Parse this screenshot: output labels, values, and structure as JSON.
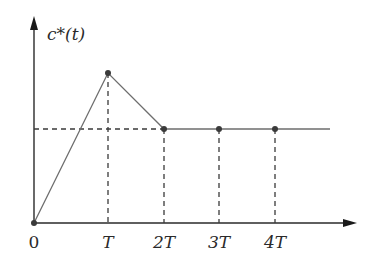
{
  "diagram": {
    "y_axis_label": "c*(t)",
    "x_tick_labels": [
      "0",
      "T",
      "2T",
      "3T",
      "4T"
    ],
    "sample_points": [
      {
        "t": "0",
        "level": "zero"
      },
      {
        "t": "T",
        "level": "peak"
      },
      {
        "t": "2T",
        "level": "steady"
      },
      {
        "t": "3T",
        "level": "steady"
      },
      {
        "t": "4T",
        "level": "steady"
      }
    ],
    "colors": {
      "axis": "#2a2a2a",
      "signal": "#6e6e6e",
      "dashed": "#3a3a3a"
    }
  }
}
